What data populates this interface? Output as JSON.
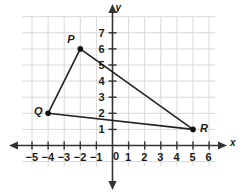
{
  "chart_data": {
    "type": "scatter",
    "title": "",
    "xlabel": "x",
    "ylabel": "y",
    "xlim": [
      -5.8,
      6.8
    ],
    "ylim": [
      -1.5,
      8.0
    ],
    "grid": true,
    "legend": null,
    "x_ticks": [
      "-5",
      "-4",
      "-3",
      "-2",
      "-1",
      "0",
      "1",
      "2",
      "3",
      "4",
      "5",
      "6"
    ],
    "x_tick_values": [
      -5,
      -4,
      -3,
      -2,
      -1,
      0,
      1,
      2,
      3,
      4,
      5,
      6
    ],
    "y_ticks": [
      "1",
      "2",
      "3",
      "4",
      "5",
      "6",
      "7"
    ],
    "y_tick_values": [
      1,
      2,
      3,
      4,
      5,
      6,
      7
    ],
    "origin_label": "0",
    "points": [
      {
        "label": "P",
        "x": -2,
        "y": 6
      },
      {
        "label": "Q",
        "x": -4,
        "y": 2
      },
      {
        "label": "R",
        "x": 5,
        "y": 1
      }
    ],
    "segments": [
      {
        "from": "P",
        "to": "Q"
      },
      {
        "from": "P",
        "to": "R"
      },
      {
        "from": "Q",
        "to": "R"
      }
    ],
    "shape": "triangle PQR",
    "colors": {
      "grid": "#d8d8d8",
      "axis": "#333333",
      "segment": "#222222",
      "point": "#111111",
      "text": "#1a1a1a",
      "background": "#ffffff"
    }
  }
}
